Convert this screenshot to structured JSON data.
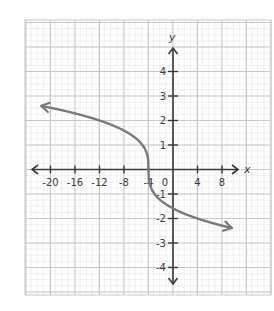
{
  "chart_data": {
    "type": "line",
    "title": "",
    "xlabel": "x",
    "ylabel": "y",
    "function": "y = -cbrt(x + 4)",
    "inflection_point": [
      -4,
      0
    ],
    "xlim": [
      -24,
      16
    ],
    "ylim": [
      -5.1,
      6.1
    ],
    "grid": true,
    "x_ticks": [
      -20,
      -16,
      -12,
      -8,
      -4,
      0,
      4,
      8
    ],
    "x_tick_labels": [
      "-20",
      "-16",
      "-12",
      "-8",
      "-4",
      "0",
      "4",
      "8"
    ],
    "y_ticks": [
      -4,
      -3,
      -2,
      -1,
      1,
      2,
      3,
      4
    ],
    "y_tick_labels": [
      "-4",
      "-3",
      "-2",
      "-1",
      "1",
      "2",
      "3",
      "4"
    ],
    "series": [
      {
        "name": "f(x)",
        "x": [
          -21.5,
          -20,
          -16,
          -12,
          -8,
          -6,
          -5,
          -4.5,
          -4,
          -3.5,
          -3,
          -2,
          0,
          4,
          8,
          9.6
        ],
        "y": [
          2.6,
          2.52,
          2.29,
          2.0,
          1.59,
          1.26,
          1.0,
          0.79,
          0,
          -0.79,
          -1.0,
          -1.26,
          -1.59,
          -2.0,
          -2.29,
          -2.37
        ],
        "color": "#7a7a7a",
        "arrows": [
          "left",
          "right"
        ]
      }
    ]
  },
  "colors": {
    "minor_grid": "#e6e6e6",
    "major_grid": "#c8c8c8",
    "axis": "#3a3a3a",
    "curve": "#7a7a7a"
  },
  "labels": {
    "x_axis_name": "x",
    "y_axis_name": "y",
    "origin": "0"
  }
}
